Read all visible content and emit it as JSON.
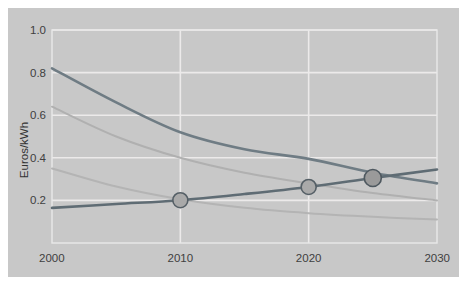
{
  "figure": {
    "background_color": "#ffffff",
    "panel_color": "#c8c8c8",
    "grid_color": "#eceaea",
    "plot_border_color": "#e8e8e8"
  },
  "chart_data": {
    "type": "line",
    "title": "",
    "subtitle": "",
    "xlabel": "",
    "ylabel": "Euros/kWh",
    "xlim": [
      2000,
      2030
    ],
    "ylim": [
      0.0,
      1.0
    ],
    "grid": true,
    "legend": "none",
    "x_ticks": [
      "2000",
      "2010",
      "2020",
      "2030"
    ],
    "x_tick_values": [
      2000,
      2010,
      2020,
      2030
    ],
    "y_ticks": [
      "0.2",
      "0.4",
      "0.6",
      "0.8",
      "1.0"
    ],
    "y_tick_values": [
      0.2,
      0.4,
      0.6,
      0.8,
      1.0
    ],
    "x": [
      2000,
      2005,
      2010,
      2015,
      2020,
      2025,
      2030
    ],
    "series": [
      {
        "name": "pv-cost-high",
        "style": "dark-declining-curve",
        "color": "#6f7c84",
        "width": 2.6,
        "values": [
          0.82,
          0.66,
          0.52,
          0.44,
          0.395,
          0.33,
          0.28
        ]
      },
      {
        "name": "pv-cost-mid",
        "style": "light-declining-curve",
        "color": "#b0b0b0",
        "width": 2.0,
        "values": [
          0.64,
          0.5,
          0.4,
          0.33,
          0.28,
          0.235,
          0.2
        ]
      },
      {
        "name": "pv-cost-low",
        "style": "light-declining-curve",
        "color": "#b4b4b4",
        "width": 2.0,
        "values": [
          0.35,
          0.265,
          0.205,
          0.165,
          0.14,
          0.123,
          0.11
        ]
      },
      {
        "name": "grid-electricity-price",
        "style": "dark-rising-line",
        "color": "#5f6c74",
        "width": 2.6,
        "values": [
          0.165,
          0.183,
          0.201,
          0.23,
          0.263,
          0.305,
          0.345
        ]
      }
    ],
    "markers": [
      {
        "name": "grid-parity-2010",
        "x": 2010,
        "y": 0.201,
        "radius": 7.5,
        "fill": "#a9a9a9",
        "stroke": "#555f66"
      },
      {
        "name": "grid-parity-2020",
        "x": 2020,
        "y": 0.263,
        "radius": 7.5,
        "fill": "#a9a9a9",
        "stroke": "#555f66"
      },
      {
        "name": "grid-parity-2025",
        "x": 2025,
        "y": 0.305,
        "radius": 8.5,
        "fill": "#9a9a9a",
        "stroke": "#4e585f"
      }
    ]
  }
}
